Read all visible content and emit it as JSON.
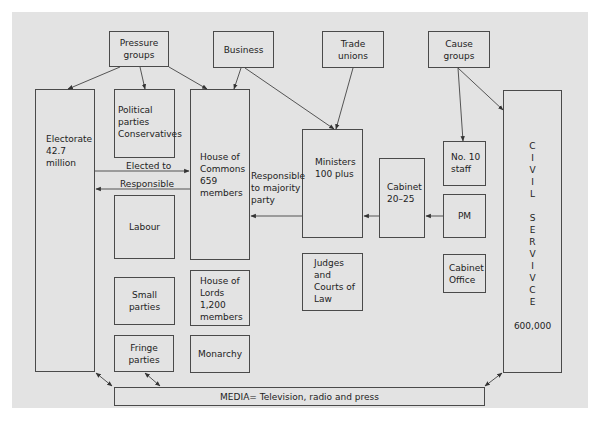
{
  "diagram": {
    "top_groups": {
      "pressure_groups": "Pressure groups",
      "business": "Business",
      "trade_unions": "Trade unions",
      "cause_groups": "Cause groups"
    },
    "electorate": {
      "label": "Electorate",
      "value": "42.7",
      "unit": "million"
    },
    "political_parties": {
      "line1": "Political",
      "line2": "parties",
      "line3": "Conservatives"
    },
    "labour": "Labour",
    "small_parties": "Small parties",
    "fringe_parties": "Fringe parties",
    "house_of_commons": {
      "line1": "House of",
      "line2": "Commons",
      "line3": "659",
      "line4": "members"
    },
    "house_of_lords": {
      "line1": "House of",
      "line2": "Lords",
      "line3": "1,200",
      "line4": "members"
    },
    "monarchy": "Monarchy",
    "ministers": {
      "line1": "Ministers",
      "line2": "100 plus"
    },
    "cabinet": {
      "line1": "Cabinet",
      "line2": "20–25"
    },
    "no10_staff": {
      "line1": "No. 10",
      "line2": "staff"
    },
    "pm": "PM",
    "judges": {
      "line1": "Judges",
      "line2": "and",
      "line3": "Courts of",
      "line4": "Law"
    },
    "cabinet_office": {
      "line1": "Cabinet",
      "line2": "Office"
    },
    "civil_service": {
      "letters": [
        "C",
        "I",
        "V",
        "I",
        "L",
        "",
        "S",
        "E",
        "R",
        "V",
        "I",
        "V",
        "C",
        "E"
      ],
      "value": "600,000"
    },
    "media": "MEDIA= Television, radio and press",
    "edge_labels": {
      "elected_to": "Elected to",
      "responsible": "Responsible",
      "responsible_to_majority": {
        "line1": "Responsible",
        "line2": "to majority",
        "line3": "party"
      }
    },
    "colors": {
      "background": "#e3e3e3",
      "stroke": "#4a4a4a",
      "text": "#222222"
    }
  }
}
